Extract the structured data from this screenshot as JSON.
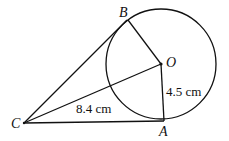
{
  "diagram": {
    "type": "circle-tangent-geometry",
    "points": {
      "O": {
        "label": "O",
        "role": "circle centre"
      },
      "A": {
        "label": "A",
        "role": "tangent point"
      },
      "B": {
        "label": "B",
        "role": "tangent point"
      },
      "C": {
        "label": "C",
        "role": "external point"
      }
    },
    "segments": [
      {
        "from": "C",
        "to": "A",
        "role": "tangent"
      },
      {
        "from": "C",
        "to": "B",
        "role": "tangent"
      },
      {
        "from": "C",
        "to": "O",
        "role": "line to centre"
      },
      {
        "from": "O",
        "to": "A",
        "role": "radius"
      },
      {
        "from": "O",
        "to": "B",
        "role": "radius"
      }
    ],
    "measurements": {
      "CO": "8.4 cm",
      "OA": "4.5 cm"
    },
    "labels": {
      "co_length": "8.4 cm",
      "oa_length": "4.5 cm"
    }
  }
}
